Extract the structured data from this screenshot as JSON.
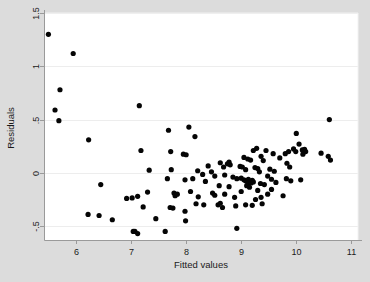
{
  "chart_data": {
    "type": "scatter",
    "title": "",
    "subtitle": "",
    "xlabel": "Fitted values",
    "ylabel": "Residuals",
    "xlim": [
      5.42,
      11.12
    ],
    "ylim": [
      -0.63,
      1.5
    ],
    "xticks": [
      6,
      7,
      8,
      9,
      10,
      11
    ],
    "xtick_labels": [
      "6",
      "7",
      "8",
      "9",
      "10",
      "11"
    ],
    "yticks": [
      1.5,
      1,
      0.5,
      0,
      -0.5
    ],
    "ytick_labels": [
      "1.5",
      "1",
      ".5",
      "0",
      "-.5"
    ],
    "grid": "horizontal",
    "legend": null,
    "marker": "filled-circle",
    "marker_color": "#000000",
    "plot_background": "#ffffff",
    "figure_background": "#dcdcdc",
    "gridline_color": "#e8e8e8",
    "axis_color": "#9a9a9a",
    "n_points": 128,
    "series": [
      {
        "name": "residuals",
        "points": [
          [
            5.5,
            1.3
          ],
          [
            5.95,
            1.12
          ],
          [
            5.71,
            0.78
          ],
          [
            5.62,
            0.59
          ],
          [
            5.69,
            0.49
          ],
          [
            7.15,
            0.63
          ],
          [
            6.23,
            0.31
          ],
          [
            7.68,
            0.4
          ],
          [
            8.05,
            0.43
          ],
          [
            8.16,
            0.34
          ],
          [
            10.6,
            0.5
          ],
          [
            7.18,
            0.21
          ],
          [
            7.72,
            0.2
          ],
          [
            7.95,
            0.175
          ],
          [
            8.0,
            0.17
          ],
          [
            10.0,
            0.37
          ],
          [
            9.28,
            0.23
          ],
          [
            9.22,
            0.21
          ],
          [
            9.45,
            0.21
          ],
          [
            9.58,
            0.18
          ],
          [
            9.95,
            0.225
          ],
          [
            9.99,
            0.2
          ],
          [
            10.05,
            0.27
          ],
          [
            10.11,
            0.215
          ],
          [
            10.15,
            0.22
          ],
          [
            10.17,
            0.2
          ],
          [
            10.12,
            0.175
          ],
          [
            10.45,
            0.185
          ],
          [
            10.58,
            0.155
          ],
          [
            10.62,
            0.12
          ],
          [
            9.05,
            0.145
          ],
          [
            9.12,
            0.13
          ],
          [
            9.17,
            0.12
          ],
          [
            9.36,
            0.155
          ],
          [
            9.4,
            0.115
          ],
          [
            9.7,
            0.14
          ],
          [
            9.8,
            0.18
          ],
          [
            9.86,
            0.2
          ],
          [
            9.83,
            0.09
          ],
          [
            9.88,
            0.055
          ],
          [
            7.33,
            0.025
          ],
          [
            7.73,
            0.03
          ],
          [
            8.4,
            0.065
          ],
          [
            8.62,
            0.095
          ],
          [
            8.68,
            0.055
          ],
          [
            8.75,
            0.085
          ],
          [
            8.78,
            0.1
          ],
          [
            8.8,
            0.075
          ],
          [
            8.98,
            0.06
          ],
          [
            9.02,
            0.055
          ],
          [
            9.08,
            0.03
          ],
          [
            9.25,
            0.05
          ],
          [
            9.3,
            0.04
          ],
          [
            9.33,
            0.01
          ],
          [
            9.52,
            0.035
          ],
          [
            9.6,
            0.015
          ],
          [
            8.21,
            0.02
          ],
          [
            8.46,
            0.01
          ],
          [
            8.3,
            -0.015
          ],
          [
            8.52,
            -0.03
          ],
          [
            8.7,
            -0.02
          ],
          [
            8.85,
            -0.04
          ],
          [
            8.92,
            -0.055
          ],
          [
            9.0,
            -0.05
          ],
          [
            9.05,
            -0.065
          ],
          [
            9.08,
            -0.075
          ],
          [
            9.11,
            -0.08
          ],
          [
            9.13,
            -0.06
          ],
          [
            9.15,
            -0.09
          ],
          [
            9.18,
            -0.095
          ],
          [
            9.2,
            -0.07
          ],
          [
            9.22,
            -0.085
          ],
          [
            9.48,
            -0.03
          ],
          [
            9.55,
            -0.06
          ],
          [
            9.63,
            -0.09
          ],
          [
            9.82,
            -0.055
          ],
          [
            9.9,
            -0.075
          ],
          [
            10.08,
            -0.065
          ],
          [
            7.66,
            -0.055
          ],
          [
            7.98,
            -0.065
          ],
          [
            8.12,
            -0.055
          ],
          [
            8.35,
            -0.08
          ],
          [
            6.45,
            -0.11
          ],
          [
            8.6,
            -0.12
          ],
          [
            8.78,
            -0.13
          ],
          [
            9.1,
            -0.12
          ],
          [
            9.15,
            -0.135
          ],
          [
            9.35,
            -0.1
          ],
          [
            9.42,
            -0.11
          ],
          [
            7.3,
            -0.18
          ],
          [
            7.78,
            -0.19
          ],
          [
            7.8,
            -0.215
          ],
          [
            7.84,
            -0.2
          ],
          [
            8.08,
            -0.175
          ],
          [
            8.22,
            -0.225
          ],
          [
            8.48,
            -0.19
          ],
          [
            8.52,
            -0.21
          ],
          [
            8.7,
            -0.2
          ],
          [
            8.88,
            -0.23
          ],
          [
            9.0,
            -0.175
          ],
          [
            9.3,
            -0.165
          ],
          [
            9.48,
            -0.2
          ],
          [
            9.55,
            -0.155
          ],
          [
            6.92,
            -0.24
          ],
          [
            7.02,
            -0.235
          ],
          [
            7.12,
            -0.22
          ],
          [
            9.76,
            -0.215
          ],
          [
            9.26,
            -0.25
          ],
          [
            7.22,
            -0.32
          ],
          [
            8.18,
            -0.29
          ],
          [
            8.32,
            -0.3
          ],
          [
            8.58,
            -0.3
          ],
          [
            8.62,
            -0.285
          ],
          [
            8.66,
            -0.325
          ],
          [
            8.9,
            -0.31
          ],
          [
            9.08,
            -0.3
          ],
          [
            9.2,
            -0.305
          ],
          [
            9.38,
            -0.29
          ],
          [
            7.71,
            -0.325
          ],
          [
            7.76,
            -0.33
          ],
          [
            7.98,
            -0.36
          ],
          [
            6.22,
            -0.39
          ],
          [
            6.42,
            -0.4
          ],
          [
            6.66,
            -0.44
          ],
          [
            7.45,
            -0.43
          ],
          [
            7.99,
            -0.45
          ],
          [
            9.36,
            -0.23
          ],
          [
            7.04,
            -0.55
          ],
          [
            7.07,
            -0.55
          ],
          [
            7.12,
            -0.57
          ],
          [
            7.62,
            -0.55
          ],
          [
            8.92,
            -0.52
          ]
        ]
      }
    ]
  }
}
